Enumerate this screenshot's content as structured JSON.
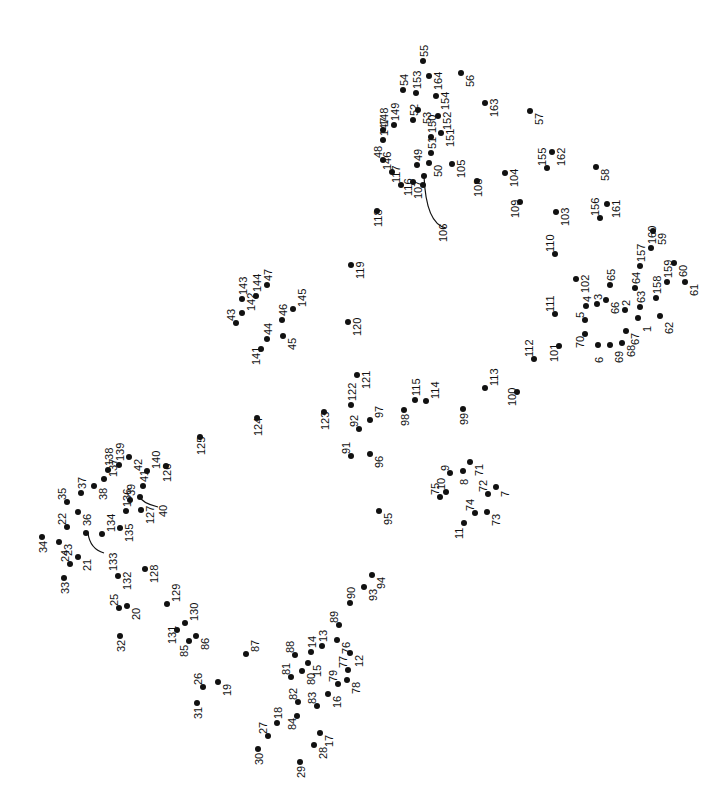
{
  "puzzle": {
    "type": "connect-the-dots",
    "label_orientation": "rotated -90deg",
    "dot_color": "#111111",
    "curves": [
      {
        "from": [
          424,
          176
        ],
        "to": [
          446,
          228
        ],
        "label": "106"
      },
      {
        "from": [
          88,
          533
        ],
        "to": [
          104,
          553
        ],
        "label": "133"
      },
      {
        "from": [
          140,
          497
        ],
        "to": [
          158,
          507
        ],
        "label": "40"
      }
    ],
    "dots": [
      {
        "n": "1",
        "x": 638,
        "y": 318,
        "lx": 4,
        "ly": 14
      },
      {
        "n": "2",
        "x": 625,
        "y": 310,
        "lx": -4,
        "ly": -4
      },
      {
        "n": "3",
        "x": 597,
        "y": 304,
        "lx": -4,
        "ly": -4
      },
      {
        "n": "4",
        "x": 586,
        "y": 306,
        "lx": -4,
        "ly": -4
      },
      {
        "n": "5",
        "x": 585,
        "y": 320,
        "lx": -10,
        "ly": -2
      },
      {
        "n": "6",
        "x": 598,
        "y": 345,
        "lx": -4,
        "ly": 18
      },
      {
        "n": "7",
        "x": 496,
        "y": 487,
        "lx": 4,
        "ly": 10
      },
      {
        "n": "8",
        "x": 463,
        "y": 471,
        "lx": -4,
        "ly": 14
      },
      {
        "n": "9",
        "x": 450,
        "y": 473,
        "lx": -10,
        "ly": -2
      },
      {
        "n": "10",
        "x": 446,
        "y": 492,
        "lx": -10,
        "ly": -2
      },
      {
        "n": "11",
        "x": 464,
        "y": 523,
        "lx": -10,
        "ly": 16
      },
      {
        "n": "12",
        "x": 350,
        "y": 653,
        "lx": 4,
        "ly": 14
      },
      {
        "n": "13",
        "x": 322,
        "y": 646,
        "lx": -4,
        "ly": -4
      },
      {
        "n": "14",
        "x": 311,
        "y": 652,
        "lx": -4,
        "ly": -4
      },
      {
        "n": "15",
        "x": 308,
        "y": 663,
        "lx": 4,
        "ly": 14
      },
      {
        "n": "16",
        "x": 328,
        "y": 694,
        "lx": 4,
        "ly": 14
      },
      {
        "n": "17",
        "x": 320,
        "y": 733,
        "lx": 4,
        "ly": 14
      },
      {
        "n": "18",
        "x": 277,
        "y": 723,
        "lx": -4,
        "ly": -4
      },
      {
        "n": "19",
        "x": 218,
        "y": 682,
        "lx": 4,
        "ly": 14
      },
      {
        "n": "20",
        "x": 127,
        "y": 606,
        "lx": 4,
        "ly": 14
      },
      {
        "n": "21",
        "x": 78,
        "y": 557,
        "lx": 4,
        "ly": 14
      },
      {
        "n": "22",
        "x": 67,
        "y": 527,
        "lx": -10,
        "ly": -2
      },
      {
        "n": "23",
        "x": 59,
        "y": 542,
        "lx": 4,
        "ly": 14
      },
      {
        "n": "24",
        "x": 70,
        "y": 564,
        "lx": -10,
        "ly": -2
      },
      {
        "n": "25",
        "x": 119,
        "y": 608,
        "lx": -10,
        "ly": -2
      },
      {
        "n": "26",
        "x": 203,
        "y": 687,
        "lx": -10,
        "ly": -2
      },
      {
        "n": "27",
        "x": 268,
        "y": 736,
        "lx": -10,
        "ly": -2
      },
      {
        "n": "28",
        "x": 314,
        "y": 745,
        "lx": 4,
        "ly": 14
      },
      {
        "n": "29",
        "x": 300,
        "y": 762,
        "lx": -4,
        "ly": 16
      },
      {
        "n": "30",
        "x": 258,
        "y": 749,
        "lx": -4,
        "ly": 16
      },
      {
        "n": "31",
        "x": 197,
        "y": 703,
        "lx": -4,
        "ly": 16
      },
      {
        "n": "32",
        "x": 120,
        "y": 636,
        "lx": -4,
        "ly": 16
      },
      {
        "n": "33",
        "x": 64,
        "y": 578,
        "lx": -4,
        "ly": 16
      },
      {
        "n": "34",
        "x": 42,
        "y": 537,
        "lx": -4,
        "ly": 16
      },
      {
        "n": "35",
        "x": 67,
        "y": 502,
        "lx": -10,
        "ly": -2
      },
      {
        "n": "36",
        "x": 78,
        "y": 512,
        "lx": 4,
        "ly": 14
      },
      {
        "n": "37",
        "x": 81,
        "y": 493,
        "lx": -4,
        "ly": -4
      },
      {
        "n": "38",
        "x": 94,
        "y": 486,
        "lx": 4,
        "ly": 14
      },
      {
        "n": "39",
        "x": 130,
        "y": 500,
        "lx": -4,
        "ly": -4
      },
      {
        "n": "40",
        "x": 140,
        "y": 497,
        "lx": 18,
        "ly": 20
      },
      {
        "n": "41",
        "x": 143,
        "y": 486,
        "lx": -4,
        "ly": -4
      },
      {
        "n": "42",
        "x": 129,
        "y": 457,
        "lx": 4,
        "ly": 14
      },
      {
        "n": "43",
        "x": 236,
        "y": 323,
        "lx": -10,
        "ly": -2
      },
      {
        "n": "44",
        "x": 267,
        "y": 339,
        "lx": -4,
        "ly": -4
      },
      {
        "n": "45",
        "x": 283,
        "y": 336,
        "lx": 4,
        "ly": 14
      },
      {
        "n": "46",
        "x": 282,
        "y": 320,
        "lx": -4,
        "ly": -4
      },
      {
        "n": "47",
        "x": 267,
        "y": 285,
        "lx": -4,
        "ly": -4
      },
      {
        "n": "48",
        "x": 383,
        "y": 160,
        "lx": -10,
        "ly": -2
      },
      {
        "n": "49",
        "x": 417,
        "y": 165,
        "lx": -4,
        "ly": -4
      },
      {
        "n": "50",
        "x": 429,
        "y": 163,
        "lx": 4,
        "ly": 14
      },
      {
        "n": "51",
        "x": 431,
        "y": 153,
        "lx": -4,
        "ly": -4
      },
      {
        "n": "52",
        "x": 413,
        "y": 120,
        "lx": -4,
        "ly": -4
      },
      {
        "n": "53",
        "x": 418,
        "y": 110,
        "lx": 4,
        "ly": 14
      },
      {
        "n": "54",
        "x": 403,
        "y": 90,
        "lx": -4,
        "ly": -4
      },
      {
        "n": "55",
        "x": 423,
        "y": 61,
        "lx": -4,
        "ly": -4
      },
      {
        "n": "56",
        "x": 461,
        "y": 73,
        "lx": 4,
        "ly": 14
      },
      {
        "n": "57",
        "x": 530,
        "y": 111,
        "lx": 4,
        "ly": 14
      },
      {
        "n": "58",
        "x": 596,
        "y": 167,
        "lx": 4,
        "ly": 14
      },
      {
        "n": "59",
        "x": 653,
        "y": 231,
        "lx": 4,
        "ly": 14
      },
      {
        "n": "60",
        "x": 674,
        "y": 263,
        "lx": 4,
        "ly": 14
      },
      {
        "n": "61",
        "x": 685,
        "y": 282,
        "lx": 4,
        "ly": 14
      },
      {
        "n": "62",
        "x": 660,
        "y": 316,
        "lx": 4,
        "ly": 18
      },
      {
        "n": "63",
        "x": 640,
        "y": 307,
        "lx": -4,
        "ly": -4
      },
      {
        "n": "64",
        "x": 635,
        "y": 288,
        "lx": -4,
        "ly": -4
      },
      {
        "n": "65",
        "x": 610,
        "y": 285,
        "lx": -4,
        "ly": -4
      },
      {
        "n": "66",
        "x": 606,
        "y": 300,
        "lx": 4,
        "ly": 14
      },
      {
        "n": "67",
        "x": 626,
        "y": 331,
        "lx": 4,
        "ly": 14
      },
      {
        "n": "68",
        "x": 622,
        "y": 343,
        "lx": 4,
        "ly": 14
      },
      {
        "n": "69",
        "x": 610,
        "y": 345,
        "lx": 4,
        "ly": 18
      },
      {
        "n": "70",
        "x": 585,
        "y": 334,
        "lx": -10,
        "ly": 14
      },
      {
        "n": "71",
        "x": 470,
        "y": 462,
        "lx": 4,
        "ly": 14
      },
      {
        "n": "72",
        "x": 488,
        "y": 494,
        "lx": -10,
        "ly": -2
      },
      {
        "n": "73",
        "x": 487,
        "y": 512,
        "lx": 4,
        "ly": 14
      },
      {
        "n": "74",
        "x": 475,
        "y": 513,
        "lx": -10,
        "ly": -2
      },
      {
        "n": "75",
        "x": 440,
        "y": 497,
        "lx": -10,
        "ly": -2
      },
      {
        "n": "76",
        "x": 337,
        "y": 640,
        "lx": 4,
        "ly": 14
      },
      {
        "n": "77",
        "x": 348,
        "y": 670,
        "lx": -10,
        "ly": -2
      },
      {
        "n": "78",
        "x": 347,
        "y": 680,
        "lx": 4,
        "ly": 14
      },
      {
        "n": "79",
        "x": 338,
        "y": 684,
        "lx": -10,
        "ly": -2
      },
      {
        "n": "80",
        "x": 302,
        "y": 671,
        "lx": 4,
        "ly": 14
      },
      {
        "n": "81",
        "x": 291,
        "y": 677,
        "lx": -10,
        "ly": -2
      },
      {
        "n": "82",
        "x": 298,
        "y": 702,
        "lx": -10,
        "ly": -2
      },
      {
        "n": "83",
        "x": 317,
        "y": 706,
        "lx": -10,
        "ly": -2
      },
      {
        "n": "84",
        "x": 297,
        "y": 716,
        "lx": -10,
        "ly": 14
      },
      {
        "n": "85",
        "x": 189,
        "y": 641,
        "lx": -10,
        "ly": 16
      },
      {
        "n": "86",
        "x": 196,
        "y": 636,
        "lx": 4,
        "ly": 14
      },
      {
        "n": "87",
        "x": 246,
        "y": 654,
        "lx": 4,
        "ly": -2
      },
      {
        "n": "88",
        "x": 295,
        "y": 655,
        "lx": -10,
        "ly": -2
      },
      {
        "n": "89",
        "x": 339,
        "y": 625,
        "lx": -10,
        "ly": -2
      },
      {
        "n": "90",
        "x": 350,
        "y": 603,
        "lx": -4,
        "ly": -4
      },
      {
        "n": "91",
        "x": 351,
        "y": 456,
        "lx": -10,
        "ly": -2
      },
      {
        "n": "92",
        "x": 359,
        "y": 429,
        "lx": -10,
        "ly": -2
      },
      {
        "n": "93",
        "x": 364,
        "y": 587,
        "lx": 4,
        "ly": 14
      },
      {
        "n": "94",
        "x": 372,
        "y": 575,
        "lx": 4,
        "ly": 14
      },
      {
        "n": "95",
        "x": 379,
        "y": 511,
        "lx": 4,
        "ly": 14
      },
      {
        "n": "96",
        "x": 370,
        "y": 454,
        "lx": 4,
        "ly": 14
      },
      {
        "n": "97",
        "x": 370,
        "y": 420,
        "lx": 4,
        "ly": -2
      },
      {
        "n": "98",
        "x": 404,
        "y": 410,
        "lx": -4,
        "ly": 16
      },
      {
        "n": "99",
        "x": 463,
        "y": 409,
        "lx": -4,
        "ly": 16
      },
      {
        "n": "100",
        "x": 517,
        "y": 392,
        "lx": -10,
        "ly": 14
      },
      {
        "n": "101",
        "x": 559,
        "y": 346,
        "lx": -10,
        "ly": 16
      },
      {
        "n": "102",
        "x": 576,
        "y": 279,
        "lx": 4,
        "ly": 14
      },
      {
        "n": "103",
        "x": 556,
        "y": 212,
        "lx": 4,
        "ly": 14
      },
      {
        "n": "104",
        "x": 505,
        "y": 173,
        "lx": 4,
        "ly": 14
      },
      {
        "n": "105",
        "x": 452,
        "y": 164,
        "lx": 4,
        "ly": 14
      },
      {
        "n": "106",
        "x": 424,
        "y": 176,
        "lx": 14,
        "ly": 66
      },
      {
        "n": "107",
        "x": 423,
        "y": 185,
        "lx": -10,
        "ly": 14
      },
      {
        "n": "108",
        "x": 477,
        "y": 181,
        "lx": -4,
        "ly": 16
      },
      {
        "n": "109",
        "x": 520,
        "y": 202,
        "lx": -10,
        "ly": 16
      },
      {
        "n": "110",
        "x": 555,
        "y": 254,
        "lx": -10,
        "ly": -2
      },
      {
        "n": "111",
        "x": 555,
        "y": 314,
        "lx": -10,
        "ly": -2
      },
      {
        "n": "112",
        "x": 534,
        "y": 359,
        "lx": -10,
        "ly": -2
      },
      {
        "n": "113",
        "x": 485,
        "y": 388,
        "lx": 4,
        "ly": -2
      },
      {
        "n": "114",
        "x": 426,
        "y": 401,
        "lx": 4,
        "ly": -2
      },
      {
        "n": "115",
        "x": 415,
        "y": 400,
        "lx": -4,
        "ly": -4
      },
      {
        "n": "116",
        "x": 413,
        "y": 182,
        "lx": -10,
        "ly": 14
      },
      {
        "n": "117",
        "x": 401,
        "y": 185,
        "lx": -10,
        "ly": -2
      },
      {
        "n": "118",
        "x": 377,
        "y": 211,
        "lx": -4,
        "ly": 16
      },
      {
        "n": "119",
        "x": 351,
        "y": 265,
        "lx": 4,
        "ly": 14
      },
      {
        "n": "120",
        "x": 348,
        "y": 322,
        "lx": 4,
        "ly": 14
      },
      {
        "n": "121",
        "x": 357,
        "y": 375,
        "lx": 4,
        "ly": 14
      },
      {
        "n": "122",
        "x": 351,
        "y": 405,
        "lx": -4,
        "ly": -4
      },
      {
        "n": "123",
        "x": 324,
        "y": 412,
        "lx": -4,
        "ly": 18
      },
      {
        "n": "124",
        "x": 257,
        "y": 418,
        "lx": -4,
        "ly": 18
      },
      {
        "n": "125",
        "x": 200,
        "y": 437,
        "lx": -4,
        "ly": 18
      },
      {
        "n": "126",
        "x": 166,
        "y": 466,
        "lx": -4,
        "ly": 16
      },
      {
        "n": "127",
        "x": 141,
        "y": 510,
        "lx": 4,
        "ly": 14
      },
      {
        "n": "128",
        "x": 145,
        "y": 569,
        "lx": 4,
        "ly": 14
      },
      {
        "n": "129",
        "x": 167,
        "y": 604,
        "lx": 4,
        "ly": -2
      },
      {
        "n": "130",
        "x": 185,
        "y": 623,
        "lx": 4,
        "ly": -2
      },
      {
        "n": "131",
        "x": 177,
        "y": 630,
        "lx": -10,
        "ly": 14
      },
      {
        "n": "132",
        "x": 118,
        "y": 576,
        "lx": 4,
        "ly": 14
      },
      {
        "n": "133",
        "x": 86,
        "y": 533,
        "lx": 22,
        "ly": 38
      },
      {
        "n": "134",
        "x": 102,
        "y": 534,
        "lx": 4,
        "ly": -2
      },
      {
        "n": "135",
        "x": 120,
        "y": 528,
        "lx": 4,
        "ly": 14
      },
      {
        "n": "136",
        "x": 126,
        "y": 511,
        "lx": -4,
        "ly": -4
      },
      {
        "n": "137",
        "x": 104,
        "y": 479,
        "lx": 4,
        "ly": -2
      },
      {
        "n": "138",
        "x": 108,
        "y": 470,
        "lx": -4,
        "ly": -4
      },
      {
        "n": "139",
        "x": 119,
        "y": 465,
        "lx": -4,
        "ly": -4
      },
      {
        "n": "140",
        "x": 147,
        "y": 471,
        "lx": 4,
        "ly": -2
      },
      {
        "n": "141",
        "x": 261,
        "y": 349,
        "lx": -10,
        "ly": 16
      },
      {
        "n": "142",
        "x": 242,
        "y": 313,
        "lx": 4,
        "ly": -2
      },
      {
        "n": "143",
        "x": 242,
        "y": 299,
        "lx": -4,
        "ly": -4
      },
      {
        "n": "144",
        "x": 256,
        "y": 296,
        "lx": -4,
        "ly": -4
      },
      {
        "n": "145",
        "x": 293,
        "y": 309,
        "lx": 4,
        "ly": -2
      },
      {
        "n": "146",
        "x": 392,
        "y": 172,
        "lx": -10,
        "ly": -2
      },
      {
        "n": "147",
        "x": 383,
        "y": 140,
        "lx": -4,
        "ly": -4
      },
      {
        "n": "148",
        "x": 383,
        "y": 130,
        "lx": -4,
        "ly": -4
      },
      {
        "n": "149",
        "x": 394,
        "y": 125,
        "lx": -4,
        "ly": -4
      },
      {
        "n": "150",
        "x": 431,
        "y": 137,
        "lx": -4,
        "ly": -4
      },
      {
        "n": "151",
        "x": 441,
        "y": 133,
        "lx": 4,
        "ly": 14
      },
      {
        "n": "152",
        "x": 438,
        "y": 116,
        "lx": 4,
        "ly": 14
      },
      {
        "n": "153",
        "x": 416,
        "y": 93,
        "lx": -4,
        "ly": -4
      },
      {
        "n": "154",
        "x": 436,
        "y": 96,
        "lx": 4,
        "ly": 14
      },
      {
        "n": "155",
        "x": 547,
        "y": 168,
        "lx": -10,
        "ly": -2
      },
      {
        "n": "156",
        "x": 600,
        "y": 218,
        "lx": -10,
        "ly": -2
      },
      {
        "n": "157",
        "x": 640,
        "y": 266,
        "lx": -4,
        "ly": -4
      },
      {
        "n": "158",
        "x": 656,
        "y": 298,
        "lx": -4,
        "ly": -4
      },
      {
        "n": "159",
        "x": 667,
        "y": 282,
        "lx": -4,
        "ly": -4
      },
      {
        "n": "160",
        "x": 651,
        "y": 248,
        "lx": -4,
        "ly": -4
      },
      {
        "n": "161",
        "x": 607,
        "y": 204,
        "lx": 4,
        "ly": 14
      },
      {
        "n": "162",
        "x": 552,
        "y": 152,
        "lx": 4,
        "ly": 14
      },
      {
        "n": "163",
        "x": 485,
        "y": 103,
        "lx": 4,
        "ly": 14
      },
      {
        "n": "164",
        "x": 429,
        "y": 76,
        "lx": 4,
        "ly": 14
      }
    ]
  }
}
